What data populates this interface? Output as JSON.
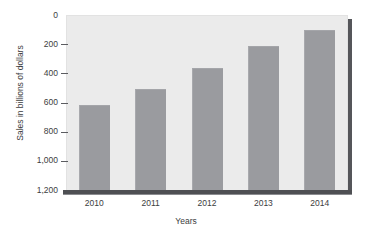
{
  "chart_data": {
    "type": "bar",
    "title": "",
    "subtitle": "",
    "xlabel": "Years",
    "ylabel": "Sales in billions of dollars",
    "categories": [
      "2010",
      "2011",
      "2012",
      "2013",
      "2014"
    ],
    "values": [
      580,
      695,
      840,
      985,
      1100
    ],
    "series": [
      {
        "name": "Sales",
        "values": [
          580,
          695,
          840,
          985,
          1100
        ]
      }
    ],
    "ylim": [
      0,
      1200
    ],
    "ytick_values": [
      0,
      200,
      400,
      600,
      800,
      1000,
      1200
    ],
    "ytick_labels": [
      "0",
      "200",
      "400",
      "600",
      "800",
      "1,000",
      "1,200"
    ],
    "grid": false,
    "legend": false,
    "legend_position": "none",
    "bar_color": "#9a9b9f",
    "plot_background": "#ebebeb",
    "axis_color": "#4e4f53",
    "annotations": []
  }
}
